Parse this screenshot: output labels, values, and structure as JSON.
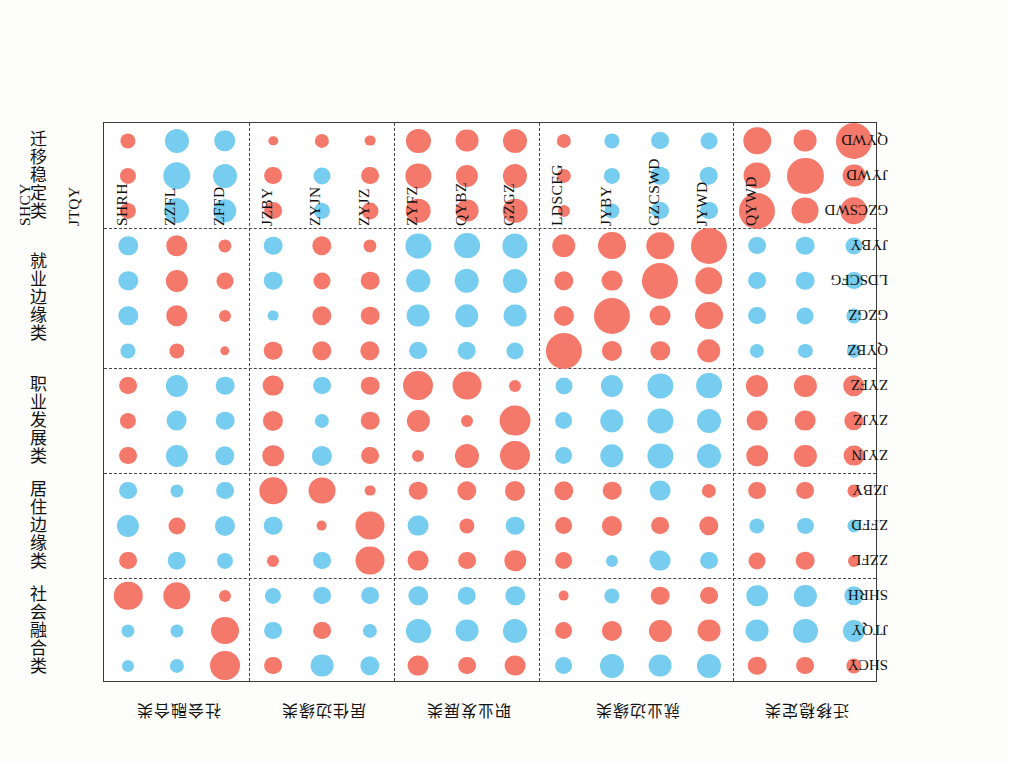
{
  "figure": {
    "top_cut_text": "",
    "colors": {
      "positive": "#F4796B",
      "negative": "#77CDEF",
      "frame": "#3a3a3a",
      "separator": "#444444"
    }
  },
  "axes": {
    "columns": [
      "SHCY",
      "JTQY",
      "SHRH",
      "ZZFL",
      "ZFFD",
      "JZBY",
      "ZYJN",
      "ZYJZ",
      "ZYFZ",
      "QYBZ",
      "GZGZ",
      "LDSCFG",
      "JYBY",
      "GZCSWD",
      "JYWD",
      "QYWD"
    ],
    "rows": [
      "QYWD",
      "JYWD",
      "GZCSWD",
      "JYBY",
      "LDSCFG",
      "GZGZ",
      "QYBZ",
      "ZYFZ",
      "ZYJZ",
      "ZYJN",
      "JZBY",
      "ZFFD",
      "ZZFL",
      "SHRH",
      "JTQY",
      "SHCY"
    ],
    "left_groups": [
      "迁移稳定类",
      "就业边缘类",
      "职业发展类",
      "居住边缘类",
      "社会融合类"
    ],
    "bottom_groups": [
      "社会融合类",
      "居住边缘类",
      "职业发展类",
      "就业边缘类",
      "迁移稳定类"
    ],
    "column_group_breaks": [
      3,
      6,
      9,
      13
    ],
    "row_group_breaks": [
      3,
      7,
      10,
      13
    ]
  },
  "chart_data": {
    "type": "heatmap",
    "title": "",
    "xlabel": "",
    "ylabel": "",
    "legend": [],
    "grid": true,
    "note": "Correlation bubble matrix: circle area encodes |r|, color encodes sign (red = positive, blue = negative). Rows listed top-to-bottom, values aligned to columns list.",
    "categories": [
      "SHCY",
      "JTQY",
      "SHRH",
      "ZZFL",
      "ZFFD",
      "JZBY",
      "ZYJN",
      "ZYJZ",
      "ZYFZ",
      "QYBZ",
      "GZGZ",
      "LDSCFG",
      "JYBY",
      "GZCSWD",
      "JYWD",
      "QYWD"
    ],
    "series": [
      {
        "name": "QYWD",
        "values": [
          0.16,
          -0.4,
          -0.32,
          0.06,
          0.14,
          0.08,
          0.4,
          0.36,
          0.4,
          0.14,
          -0.16,
          -0.22,
          -0.2,
          0.52,
          0.36,
          0.9
        ]
      },
      {
        "name": "JYWD",
        "values": [
          0.18,
          -0.52,
          -0.4,
          0.22,
          -0.2,
          0.22,
          0.44,
          0.34,
          0.4,
          0.14,
          -0.18,
          -0.24,
          -0.24,
          0.5,
          0.9,
          0.36
        ]
      },
      {
        "name": "GZCSWD",
        "values": [
          0.18,
          -0.46,
          -0.38,
          0.22,
          -0.18,
          0.2,
          0.42,
          0.36,
          0.42,
          0.1,
          -0.16,
          -0.22,
          -0.22,
          0.9,
          0.5,
          0.52
        ]
      },
      {
        "name": "JYBY",
        "values": [
          -0.26,
          0.32,
          0.12,
          -0.24,
          0.26,
          0.12,
          -0.44,
          -0.46,
          -0.44,
          0.38,
          0.54,
          0.52,
          0.9,
          -0.22,
          -0.24,
          -0.2
        ]
      },
      {
        "name": "LDSCFG",
        "values": [
          -0.26,
          0.34,
          0.2,
          -0.24,
          0.2,
          0.24,
          -0.38,
          -0.42,
          -0.4,
          0.26,
          0.3,
          0.9,
          0.52,
          -0.22,
          -0.24,
          -0.22
        ]
      },
      {
        "name": "GZGZ",
        "values": [
          -0.26,
          0.32,
          0.1,
          -0.08,
          0.26,
          0.24,
          -0.36,
          -0.38,
          -0.36,
          0.28,
          0.9,
          0.3,
          0.54,
          -0.22,
          -0.2,
          -0.16
        ]
      },
      {
        "name": "QYBZ",
        "values": [
          -0.16,
          0.16,
          0.06,
          0.24,
          0.26,
          0.26,
          -0.22,
          -0.24,
          -0.2,
          0.9,
          0.28,
          0.26,
          0.38,
          -0.14,
          -0.14,
          -0.14
        ]
      },
      {
        "name": "ZYFZ",
        "values": [
          0.22,
          -0.34,
          -0.24,
          0.3,
          -0.22,
          0.24,
          0.62,
          0.58,
          0.1,
          -0.2,
          -0.34,
          -0.44,
          -0.46,
          0.34,
          0.34,
          0.32
        ]
      },
      {
        "name": "ZYJZ",
        "values": [
          0.18,
          -0.3,
          -0.24,
          0.28,
          -0.14,
          0.24,
          0.34,
          0.1,
          0.66,
          -0.22,
          -0.38,
          -0.44,
          -0.4,
          0.3,
          0.3,
          0.26
        ]
      },
      {
        "name": "ZYJN",
        "values": [
          0.22,
          -0.34,
          -0.26,
          0.32,
          -0.28,
          0.22,
          0.1,
          0.4,
          0.62,
          -0.22,
          -0.38,
          -0.44,
          -0.4,
          0.32,
          0.34,
          0.3
        ]
      },
      {
        "name": "JZBY",
        "values": [
          -0.22,
          -0.12,
          -0.22,
          0.52,
          0.5,
          0.08,
          0.24,
          0.26,
          0.28,
          0.26,
          0.24,
          -0.3,
          0.14,
          0.22,
          0.22,
          0.12
        ]
      },
      {
        "name": "ZFFD",
        "values": [
          -0.34,
          0.2,
          -0.28,
          -0.24,
          0.08,
          0.58,
          -0.3,
          0.16,
          -0.24,
          0.22,
          0.28,
          0.22,
          0.26,
          -0.16,
          -0.18,
          -0.12
        ]
      },
      {
        "name": "ZZFL",
        "values": [
          0.22,
          -0.24,
          -0.18,
          0.1,
          -0.22,
          0.58,
          0.3,
          0.22,
          0.32,
          0.22,
          -0.1,
          -0.3,
          -0.22,
          0.2,
          0.24,
          0.1
        ]
      },
      {
        "name": "SHRH",
        "values": [
          0.56,
          0.52,
          0.1,
          -0.18,
          -0.22,
          -0.22,
          -0.26,
          -0.24,
          -0.26,
          0.08,
          -0.16,
          0.24,
          0.22,
          -0.32,
          -0.34,
          -0.26
        ]
      },
      {
        "name": "JTQY",
        "values": [
          -0.12,
          -0.12,
          0.54,
          -0.22,
          0.22,
          -0.14,
          -0.4,
          -0.36,
          -0.4,
          0.22,
          0.28,
          0.34,
          0.36,
          -0.36,
          -0.4,
          -0.34
        ]
      },
      {
        "name": "SHCY",
        "values": [
          -0.1,
          -0.14,
          0.62,
          0.22,
          -0.36,
          -0.26,
          0.3,
          0.22,
          0.3,
          -0.22,
          -0.4,
          -0.36,
          -0.4,
          0.24,
          0.22,
          0.16
        ]
      }
    ]
  }
}
